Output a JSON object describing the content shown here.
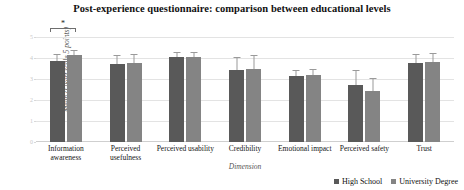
{
  "chart_data": {
    "type": "bar",
    "title": "Post-experience questionnaire: comparison between educational levels",
    "xlabel": "Dimension",
    "ylabel": "Mean (Likert scale 5 points)",
    "ylim": [
      0,
      5
    ],
    "yticks": [
      "0",
      "1",
      "2",
      "3",
      "4",
      "5"
    ],
    "grid": true,
    "legend_position": "bottom-right",
    "categories": [
      "Information awareness",
      "Perceived usefulness",
      "Perceived usability",
      "Credibility",
      "Emotional impact",
      "Perceived safety",
      "Trust"
    ],
    "series": [
      {
        "name": "High School",
        "color": "#595959",
        "values": [
          3.85,
          3.7,
          4.05,
          3.45,
          3.15,
          2.7,
          3.75
        ],
        "errors": [
          0.35,
          0.45,
          0.25,
          0.6,
          0.3,
          0.75,
          0.45
        ]
      },
      {
        "name": "University Degree",
        "color": "#848484",
        "values": [
          4.15,
          3.75,
          4.05,
          3.5,
          3.2,
          2.45,
          3.8
        ],
        "errors": [
          0.25,
          0.45,
          0.25,
          0.65,
          0.3,
          0.6,
          0.45
        ]
      }
    ],
    "annotations": [
      {
        "name": "significance-bracket",
        "group": "Information awareness",
        "label": "*"
      }
    ]
  },
  "legend": {
    "items": [
      {
        "label": "High School"
      },
      {
        "label": "University Degree"
      }
    ]
  }
}
